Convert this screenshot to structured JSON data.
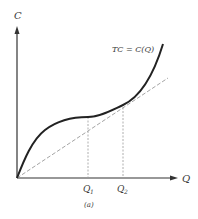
{
  "diagram": {
    "y_axis_label": "C",
    "x_axis_label": "Q",
    "curve_label": "TC = C(Q)",
    "x_ticks": [
      {
        "base": "Q",
        "sub": "1"
      },
      {
        "base": "Q",
        "sub": "2"
      }
    ],
    "caption": "(a)",
    "elements": [
      {
        "type": "curve",
        "name": "total-cost-curve",
        "style": "solid",
        "color": "#222222"
      },
      {
        "type": "ray",
        "name": "ray-from-origin",
        "style": "dashed",
        "color": "#999999"
      },
      {
        "type": "guide",
        "name": "q1-guide",
        "style": "dashed",
        "color": "#999999"
      },
      {
        "type": "guide",
        "name": "q2-guide",
        "style": "dashed",
        "color": "#999999"
      }
    ]
  }
}
